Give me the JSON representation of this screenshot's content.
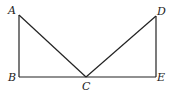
{
  "diagram": {
    "points": {
      "A": {
        "label": "A",
        "x": 19,
        "y": 15
      },
      "B": {
        "label": "B",
        "x": 19,
        "y": 77
      },
      "C": {
        "label": "C",
        "x": 86,
        "y": 77
      },
      "D": {
        "label": "D",
        "x": 156,
        "y": 16
      },
      "E": {
        "label": "E",
        "x": 156,
        "y": 77
      }
    },
    "segments": [
      "AB",
      "BE",
      "AC",
      "CD",
      "DE"
    ],
    "stroke_color": "#222222"
  }
}
